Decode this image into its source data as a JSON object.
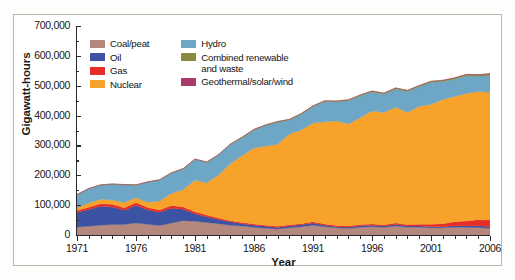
{
  "figure": {
    "y_axis_title": "Gigawatt-hours",
    "x_axis_title": "Year"
  },
  "legend": {
    "left_column": [
      {
        "label": "Coal/peat",
        "color": "#b4887c",
        "key": "coal_peat"
      },
      {
        "label": "Oil",
        "color": "#3c52a2",
        "key": "oil"
      },
      {
        "label": "Gas",
        "color": "#e62e26",
        "key": "gas"
      },
      {
        "label": "Nuclear",
        "color": "#f6a22b",
        "key": "nuclear"
      }
    ],
    "right_column": [
      {
        "label": "Hydro",
        "color": "#6ea6c6",
        "key": "hydro"
      },
      {
        "label": "Combined renewable\nand waste",
        "color": "#8b8a41",
        "key": "combined_renewable_and_waste"
      },
      {
        "label": "Geothermal/solar/wind",
        "color": "#a93a6c",
        "key": "geothermal_solar_wind"
      }
    ]
  },
  "chart_data": {
    "type": "area",
    "stacked": true,
    "title": "",
    "xlabel": "Year",
    "ylabel": "Gigawatt-hours",
    "xlim": [
      1971,
      2006
    ],
    "ylim": [
      0,
      700000
    ],
    "ytick_step": 100000,
    "yticks": [
      0,
      100000,
      200000,
      300000,
      400000,
      500000,
      600000,
      700000
    ],
    "ytick_labels": [
      "0",
      "100,000",
      "200,000",
      "300,000",
      "400,000",
      "500,000",
      "600,000",
      "700,000"
    ],
    "xticks": [
      1971,
      1976,
      1981,
      1986,
      1991,
      1996,
      2001,
      2006
    ],
    "xtick_labels": [
      "1971",
      "1976",
      "1981",
      "1986",
      "1991",
      "1996",
      "2001",
      "2006"
    ],
    "grid": false,
    "legend_position": "upper-left-inside",
    "x": [
      1971,
      1972,
      1973,
      1974,
      1975,
      1976,
      1977,
      1978,
      1979,
      1980,
      1981,
      1982,
      1983,
      1984,
      1985,
      1986,
      1987,
      1988,
      1989,
      1990,
      1991,
      1992,
      1993,
      1994,
      1995,
      1996,
      1997,
      1998,
      1999,
      2000,
      2001,
      2002,
      2003,
      2004,
      2005,
      2006
    ],
    "series": [
      {
        "name": "Coal/peat",
        "color": "#b4887c",
        "values": [
          27000,
          29000,
          33000,
          35000,
          35000,
          40000,
          36000,
          32000,
          40000,
          48000,
          46000,
          42000,
          38000,
          33000,
          30000,
          26000,
          23000,
          20000,
          24000,
          28000,
          33000,
          28000,
          24000,
          22000,
          26000,
          28000,
          26000,
          30000,
          26000,
          26000,
          24000,
          24000,
          26000,
          26000,
          25000,
          23000
        ]
      },
      {
        "name": "Oil",
        "color": "#3c52a2",
        "values": [
          48000,
          56000,
          63000,
          59000,
          48000,
          60000,
          48000,
          44000,
          50000,
          38000,
          25000,
          19000,
          14000,
          11000,
          8000,
          7000,
          6000,
          5000,
          6000,
          6000,
          7000,
          5000,
          4000,
          4000,
          5000,
          5000,
          4000,
          5000,
          4000,
          4000,
          4000,
          4000,
          5000,
          5000,
          6000,
          5000
        ]
      },
      {
        "name": "Gas",
        "color": "#e62e26",
        "values": [
          7000,
          8000,
          9000,
          9000,
          8000,
          9000,
          8000,
          8000,
          9000,
          8000,
          7000,
          6000,
          5000,
          4000,
          4000,
          4000,
          4000,
          4000,
          4000,
          4000,
          4000,
          4000,
          4000,
          4000,
          4000,
          4000,
          4000,
          5000,
          5000,
          6000,
          8000,
          10000,
          13000,
          16000,
          20000,
          22000
        ]
      },
      {
        "name": "Nuclear",
        "color": "#f6a22b",
        "values": [
          9000,
          14000,
          15000,
          14000,
          18000,
          16000,
          18000,
          30000,
          40000,
          58000,
          105000,
          108000,
          144000,
          191000,
          224000,
          254000,
          265000,
          275000,
          304000,
          314000,
          331000,
          342000,
          350000,
          342000,
          358000,
          378000,
          376000,
          388000,
          375000,
          395000,
          401000,
          416000,
          420000,
          427000,
          430000,
          428000
        ]
      },
      {
        "name": "Hydro",
        "color": "#6ea6c6",
        "values": [
          44000,
          48000,
          47000,
          53000,
          59000,
          42000,
          67000,
          70000,
          68000,
          69000,
          70000,
          68000,
          67000,
          64000,
          60000,
          61000,
          69000,
          74000,
          47000,
          52000,
          55000,
          68000,
          64000,
          78000,
          73000,
          64000,
          62000,
          61000,
          71000,
          66000,
          74000,
          60000,
          58000,
          59000,
          51000,
          56000
        ]
      },
      {
        "name": "Combined renewable and waste",
        "color": "#8b8a41",
        "values": [
          800,
          800,
          900,
          900,
          1000,
          1000,
          1100,
          1200,
          1300,
          1400,
          1500,
          1600,
          1700,
          1800,
          1900,
          2000,
          2100,
          2200,
          2400,
          2600,
          2700,
          2800,
          2900,
          3000,
          3100,
          3200,
          3300,
          3400,
          3500,
          3700,
          3900,
          4100,
          4300,
          4500,
          4700,
          5000
        ]
      },
      {
        "name": "Geothermal/solar/wind",
        "color": "#a93a6c",
        "values": [
          0,
          0,
          0,
          0,
          0,
          0,
          0,
          0,
          0,
          0,
          0,
          0,
          0,
          0,
          0,
          0,
          0,
          0,
          0,
          0,
          0,
          0,
          0,
          0,
          0,
          0,
          0,
          100,
          100,
          100,
          200,
          300,
          400,
          600,
          1000,
          2200
        ]
      }
    ]
  }
}
